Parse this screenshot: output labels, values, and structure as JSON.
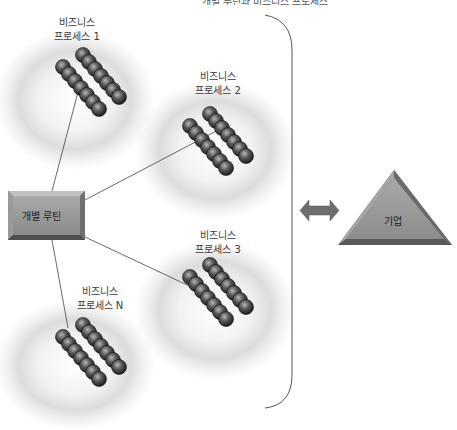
{
  "diagram": {
    "title_clipped": "개별 루틴과 비즈니스 프로세스",
    "routine": {
      "label": "개별 루틴",
      "color": "#8c8c8c"
    },
    "processes": [
      {
        "line1": "비즈니스",
        "line2": "프로세스 1"
      },
      {
        "line1": "비즈니스",
        "line2": "프로세스 2"
      },
      {
        "line1": "비즈니스",
        "line2": "프로세스 3"
      },
      {
        "line1": "비즈니스",
        "line2": "프로세스 N"
      }
    ],
    "enterprise": {
      "label": "기업",
      "color": "#8f8f8f"
    },
    "connector": {
      "icon": "double-arrow-icon",
      "color": "#6e6e6e"
    },
    "bracket": {
      "icon": "right-brace",
      "color": "#555555"
    },
    "ball_color": "#3c3c3c"
  }
}
